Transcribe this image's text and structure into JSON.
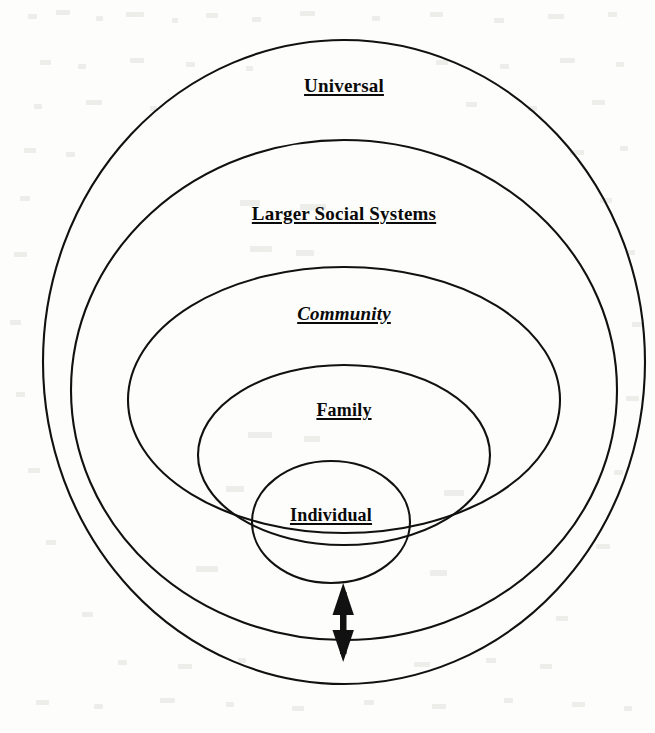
{
  "document": {
    "type": "concentric-circles-diagram",
    "title": "",
    "background_color": "#fdfdfb",
    "line_color": "#111111",
    "text_color": "#0a0a0a"
  },
  "diagram": {
    "rings": [
      {
        "label": "Universal",
        "level": 1,
        "position": "outermost",
        "cx": 344,
        "cy": 362,
        "rx": 301,
        "ry": 322,
        "label_x": 344,
        "label_y": 75
      },
      {
        "label": "Larger Social Systems",
        "level": 2,
        "cx": 344,
        "cy": 390,
        "rx": 273,
        "ry": 250,
        "label_x": 344,
        "label_y": 203
      },
      {
        "label": "Community",
        "level": 3,
        "cx": 344,
        "cy": 395,
        "rx": 216,
        "ry": 128,
        "label_x": 344,
        "label_y": 303
      },
      {
        "label": "Family",
        "level": 4,
        "cx": 344,
        "cy": 454,
        "rx": 146,
        "ry": 89,
        "label_x": 344,
        "label_y": 400
      },
      {
        "label": "Individual",
        "level": 5,
        "position": "innermost",
        "cx": 331,
        "cy": 522,
        "rx": 79,
        "ry": 61,
        "label_x": 331,
        "label_y": 505
      }
    ],
    "arrow": {
      "name": "bidirectional-arrow",
      "orientation": "vertical",
      "double_headed": true,
      "x": 343,
      "y_top": 585,
      "y_bottom": 661,
      "shaft_width": 6,
      "head_width": 22,
      "head_length": 26,
      "color": "#111111"
    }
  }
}
